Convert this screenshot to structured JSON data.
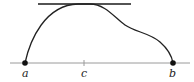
{
  "diagram": {
    "type": "function-graph",
    "labels": {
      "a": "a",
      "b": "b",
      "c": "c"
    },
    "colors": {
      "curve": "#222222",
      "axis": "#9a9a9a",
      "tangent": "#1a1a1a",
      "points": "#111111",
      "background": "#ffffff"
    }
  }
}
